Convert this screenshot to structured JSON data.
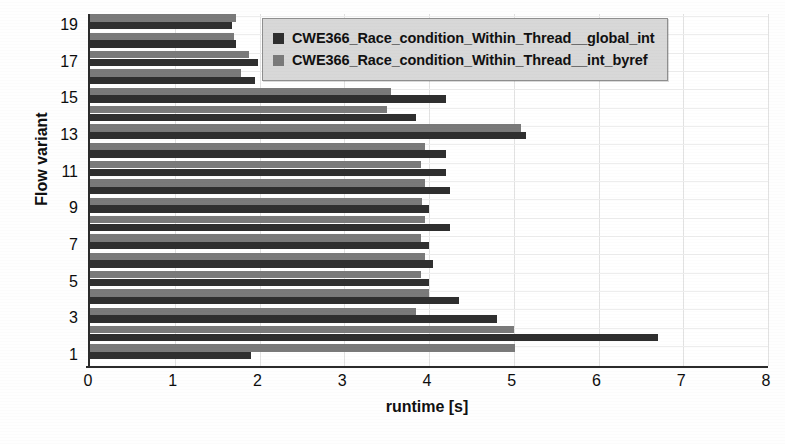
{
  "chart_data": {
    "type": "bar",
    "orientation": "horizontal",
    "title": "",
    "xlabel": "runtime [s]",
    "ylabel": "Flow variant",
    "xlim": [
      0,
      8
    ],
    "xticks": [
      0,
      1,
      2,
      3,
      4,
      5,
      6,
      7,
      8
    ],
    "xtick_labels": [
      "0",
      "1",
      "2",
      "3",
      "4",
      "5",
      "6",
      "7",
      "8"
    ],
    "ylim": [
      0.4,
      19.6
    ],
    "yticks": [
      1,
      3,
      5,
      7,
      9,
      11,
      13,
      15,
      17,
      19
    ],
    "ytick_labels": [
      "1",
      "3",
      "5",
      "7",
      "9",
      "11",
      "13",
      "15",
      "17",
      "19"
    ],
    "categories": [
      1,
      2,
      3,
      4,
      5,
      6,
      7,
      8,
      9,
      10,
      11,
      12,
      13,
      14,
      15,
      16,
      17,
      18,
      19
    ],
    "grid": true,
    "grid_axis": "both",
    "legend_position": "upper right",
    "series": [
      {
        "name": "CWE366_Race_condition_Within_Thread__global_int",
        "color": "#2f2f2f",
        "values": [
          1.9,
          6.7,
          4.8,
          4.35,
          4.0,
          4.05,
          4.0,
          4.25,
          4.0,
          4.25,
          4.2,
          4.2,
          5.15,
          3.85,
          4.2,
          1.95,
          1.98,
          1.72,
          1.68
        ]
      },
      {
        "name": "CWE366_Race_condition_Within_Thread__int_byref",
        "color": "#7a7a7a",
        "values": [
          5.02,
          5.0,
          3.85,
          4.0,
          3.9,
          3.95,
          3.9,
          3.95,
          3.92,
          3.95,
          3.9,
          3.95,
          5.08,
          3.5,
          3.55,
          1.78,
          1.88,
          1.7,
          1.72
        ]
      }
    ]
  },
  "legend": {
    "items": [
      {
        "label": "CWE366_Race_condition_Within_Thread__global_int",
        "color": "#2f2f2f"
      },
      {
        "label": "CWE366_Race_condition_Within_Thread__int_byref",
        "color": "#7a7a7a"
      }
    ]
  },
  "axes": {
    "x_title": "runtime [s]",
    "y_title": "Flow variant"
  }
}
